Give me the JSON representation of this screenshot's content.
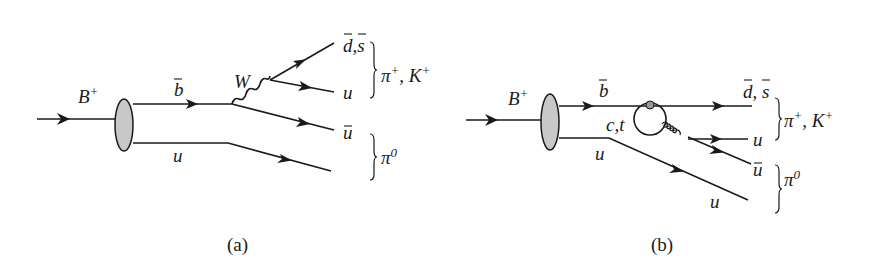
{
  "figure": {
    "colors": {
      "ink": "#1a1a1a",
      "blob_fill": "#c8c8c8",
      "background": "#ffffff"
    },
    "panels": [
      {
        "caption": "(a)",
        "description": "Tree diagram: B+ decays via b-bar → W emission",
        "labels": {
          "initial": "B",
          "initial_charge": "+",
          "b_quark": "b",
          "spectator": "u",
          "boson": "W",
          "out1": "d,s",
          "out2": "u",
          "out3": "u",
          "meson1": "π",
          "meson1_charge": "+",
          "meson1_sep": ", ",
          "meson1b": "K",
          "meson1b_charge": "+",
          "meson2": "π",
          "meson2_charge": "0"
        }
      },
      {
        "caption": "(b)",
        "description": "Penguin diagram with c,t loop and gluon emission",
        "labels": {
          "initial": "B",
          "initial_charge": "+",
          "b_quark": "b",
          "loop": "c,t",
          "spectator": "u",
          "out1": "d, s",
          "out2": "u",
          "out3": "u",
          "out4": "u",
          "meson1": "π",
          "meson1_charge": "+",
          "meson1_sep": ", ",
          "meson1b": "K",
          "meson1b_charge": "+",
          "meson2": "π",
          "meson2_charge": "0"
        }
      }
    ]
  }
}
